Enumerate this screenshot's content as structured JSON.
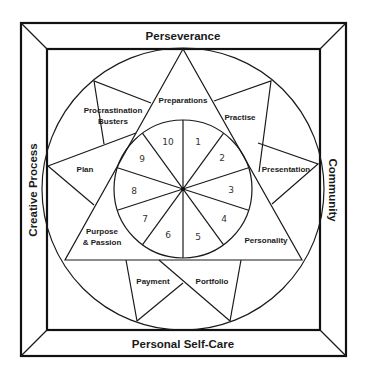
{
  "frame": {
    "top": "Perseverance",
    "bottom": "Personal Self-Care",
    "left": "Creative Process",
    "right": "Community"
  },
  "triangle": {
    "top": "Preparations",
    "bottom_left": "Purpose",
    "bottom_left_2": "& Passion",
    "bottom_right": "Personality"
  },
  "star_points": {
    "upper_left": "Procrastination",
    "upper_left_2": "Busters",
    "left": "Plan",
    "upper_right": "Practise",
    "right": "Presentation",
    "bottom_left": "Payment",
    "bottom_right": "Portfolio"
  },
  "wheel": {
    "segments": [
      "1",
      "2",
      "3",
      "4",
      "5",
      "6",
      "7",
      "8",
      "9",
      "10"
    ]
  }
}
